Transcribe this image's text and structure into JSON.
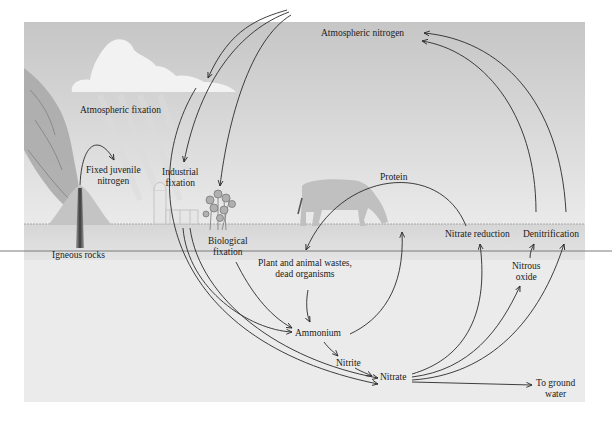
{
  "diagram": {
    "colors": {
      "sky_top": "#c9c9c9",
      "sky_bottom": "#ececec",
      "ground": "#d9d9d9",
      "underground": "#ebebeb",
      "arrow": "#2a2a2a",
      "text": "#1a1a1a",
      "rule_line": "#7a7a7a"
    },
    "labels": {
      "atmospheric_nitrogen": "Atmospheric nitrogen",
      "atmospheric_fixation": "Atmospheric fixation",
      "fixed_juvenile_nitrogen_1": "Fixed juvenile",
      "fixed_juvenile_nitrogen_2": "nitrogen",
      "industrial_fixation_1": "Industrial",
      "industrial_fixation_2": "fixation",
      "igneous_rocks": "Igneous rocks",
      "biological_fixation_1": "Biological",
      "biological_fixation_2": "fixation",
      "protein": "Protein",
      "wastes_1": "Plant and animal wastes,",
      "wastes_2": "dead organisms",
      "ammonium": "Ammonium",
      "nitrite": "Nitrite",
      "nitrate": "Nitrate",
      "nitrate_reduction": "Nitrate reduction",
      "denitrification": "Denitrification",
      "nitrous_oxide_1": "Nitrous",
      "nitrous_oxide_2": "oxide",
      "to_ground_water_1": "To ground",
      "to_ground_water_2": "water"
    },
    "illustrations": [
      "volcano-icon",
      "cloud-icon",
      "factory-icon",
      "plant-icon",
      "cow-icon"
    ],
    "flows": [
      {
        "from": "Atmospheric nitrogen",
        "to": "Atmospheric fixation"
      },
      {
        "from": "Atmospheric nitrogen",
        "to": "Industrial fixation"
      },
      {
        "from": "Atmospheric nitrogen",
        "to": "Biological fixation"
      },
      {
        "from": "Igneous rocks",
        "to": "Fixed juvenile nitrogen"
      },
      {
        "from": "Atmospheric fixation",
        "to": "Nitrate"
      },
      {
        "from": "Industrial fixation",
        "to": "Ammonium"
      },
      {
        "from": "Industrial fixation",
        "to": "Nitrate"
      },
      {
        "from": "Biological fixation",
        "to": "Ammonium"
      },
      {
        "from": "Plant and animal wastes, dead organisms",
        "to": "Ammonium"
      },
      {
        "from": "Ammonium",
        "to": "Protein"
      },
      {
        "from": "Protein",
        "to": "Plant and animal wastes, dead organisms"
      },
      {
        "from": "Ammonium",
        "to": "Nitrite"
      },
      {
        "from": "Nitrite",
        "to": "Nitrate"
      },
      {
        "from": "Nitrate",
        "to": "Nitrate reduction"
      },
      {
        "from": "Nitrate",
        "to": "Nitrous oxide"
      },
      {
        "from": "Nitrous oxide",
        "to": "Denitrification"
      },
      {
        "from": "Nitrate",
        "to": "Denitrification"
      },
      {
        "from": "Nitrate",
        "to": "To ground water"
      },
      {
        "from": "Nitrate reduction",
        "to": "Atmospheric nitrogen"
      },
      {
        "from": "Denitrification",
        "to": "Atmospheric nitrogen"
      }
    ]
  }
}
